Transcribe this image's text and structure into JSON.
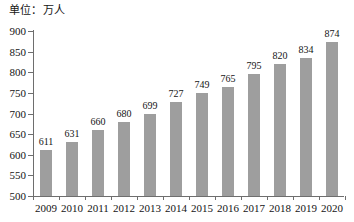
{
  "chart_data": {
    "type": "bar",
    "title": "单位：万人",
    "xlabel": "",
    "ylabel": "",
    "categories": [
      "2009",
      "2010",
      "2011",
      "2012",
      "2013",
      "2014",
      "2015",
      "2016",
      "2017",
      "2018",
      "2019",
      "2020"
    ],
    "values": [
      611,
      631,
      660,
      680,
      699,
      727,
      749,
      765,
      795,
      820,
      834,
      874
    ],
    "ylim": [
      500,
      900
    ],
    "ytick_step": 50,
    "yticks": [
      500,
      550,
      600,
      650,
      700,
      750,
      800,
      850,
      900
    ],
    "ytick_labels": [
      "500",
      "550",
      "600",
      "650",
      "700",
      "750",
      "800",
      "850",
      "900"
    ],
    "grid": false,
    "legend": null,
    "data_labels": [
      "611",
      "631",
      "660",
      "680",
      "699",
      "727",
      "749",
      "765",
      "795",
      "820",
      "834",
      "874"
    ],
    "series": [
      {
        "name": "",
        "values": [
          611,
          631,
          660,
          680,
          699,
          727,
          749,
          765,
          795,
          820,
          834,
          874
        ]
      }
    ],
    "colors": {
      "bar": "#9e9e9e",
      "axis": "#6e6e6e",
      "text": "#141414",
      "background": "#ffffff"
    }
  }
}
